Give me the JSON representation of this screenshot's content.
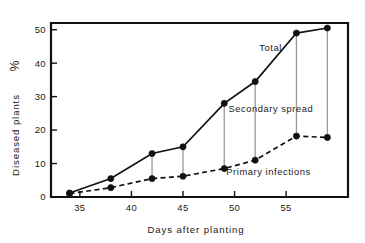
{
  "chart_data": {
    "type": "line",
    "title": "",
    "xlabel": "Days after planting",
    "ylabel": "Diseased plants  %",
    "xlim": [
      32.2,
      61.0
    ],
    "ylim": [
      0,
      52
    ],
    "xticks": [
      35,
      40,
      45,
      50,
      55
    ],
    "yticks": [
      0,
      10,
      20,
      30,
      40,
      50
    ],
    "grid": false,
    "legend": "inline-annotations",
    "x": [
      34,
      38,
      42,
      45,
      49,
      52,
      56,
      59
    ],
    "series": [
      {
        "name": "Total",
        "style": "solid",
        "marker": "filled-circle",
        "values": [
          1.2,
          5.5,
          13.0,
          15.0,
          28.0,
          34.5,
          49.0,
          50.5
        ]
      },
      {
        "name": "Primary infections",
        "style": "dashed",
        "marker": "filled-circle",
        "values": [
          1.0,
          2.8,
          5.5,
          6.2,
          8.5,
          11.0,
          18.2,
          17.8
        ]
      }
    ],
    "connectors": {
      "label": "Secondary spread",
      "x": [
        42,
        45,
        49,
        52,
        56,
        59
      ],
      "from_series": "Primary infections",
      "to_series": "Total"
    },
    "annotations": [
      {
        "id": "total",
        "text": "Total",
        "x": 52.4,
        "y": 43.5
      },
      {
        "id": "secondary-spread",
        "text": "Secondary  spread",
        "x": 49.4,
        "y": 25.3
      },
      {
        "id": "primary-infections",
        "text": "Primary  infections",
        "x": 49.2,
        "y": 6.6
      }
    ],
    "colors": {
      "ink": "#111111",
      "connector": "#9a9a9a",
      "background": "#ffffff"
    }
  },
  "axes": {
    "x_title": "Days after planting",
    "y_title": "Diseased plants",
    "y_unit_glyph": "%",
    "x_tick_labels": [
      "35",
      "40",
      "45",
      "50",
      "55"
    ],
    "y_tick_labels": [
      "0",
      "10",
      "20",
      "30",
      "40",
      "50"
    ]
  },
  "labels": {
    "total": "Total",
    "secondary_spread": "Secondary  spread",
    "primary_infections": "Primary  infections"
  }
}
